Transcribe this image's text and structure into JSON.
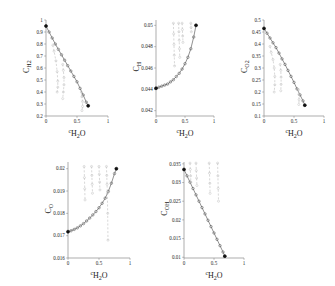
{
  "figure": {
    "background": "#ffffff",
    "axis_color": "#8a8a8a",
    "main_curve_color": "#6e6e6e",
    "branch_curve_color": "#b8b8b8",
    "endpoint_color": "#111111",
    "xlabel_prefix": "c",
    "xlabel_species": "H",
    "xlabel_species_sub": "2",
    "xlabel_species_tail": "O"
  },
  "chart_data": [
    {
      "type": "scatter",
      "panel": "top-left",
      "title": "",
      "xlabel": "cH2O",
      "ylabel": "CH2",
      "ylabel_base": "C",
      "ylabel_sub": "H",
      "ylabel_sub2": "2",
      "xlim": [
        0,
        1
      ],
      "ylim": [
        0.2,
        1
      ],
      "xticks": [
        0,
        0.5,
        1
      ],
      "xticklabels": [
        "0",
        "0.5",
        "1"
      ],
      "yticks": [
        0.2,
        0.3,
        0.4,
        0.5,
        0.6,
        0.7,
        0.8,
        0.9,
        1
      ],
      "yticklabels": [
        "0.2",
        "0.3",
        "0.4",
        "0.5",
        "0.6",
        "0.7",
        "0.8",
        "0.9",
        "1"
      ],
      "grid": false,
      "legend": "none",
      "series": [
        {
          "name": "main",
          "style": "solid-with-markers",
          "x": [
            0.0,
            0.05,
            0.1,
            0.15,
            0.2,
            0.25,
            0.3,
            0.35,
            0.4,
            0.45,
            0.5,
            0.55,
            0.6,
            0.65,
            0.68
          ],
          "y": [
            0.95,
            0.9,
            0.85,
            0.8,
            0.755,
            0.71,
            0.665,
            0.62,
            0.575,
            0.53,
            0.485,
            0.43,
            0.375,
            0.315,
            0.285
          ]
        },
        {
          "name": "branch-1",
          "style": "dashed",
          "x": [
            0.11,
            0.13,
            0.16,
            0.18,
            0.19,
            0.19,
            0.18
          ],
          "y": [
            0.79,
            0.74,
            0.66,
            0.57,
            0.49,
            0.44,
            0.4
          ]
        },
        {
          "name": "branch-2",
          "style": "dashed",
          "x": [
            0.27,
            0.28,
            0.29,
            0.29,
            0.28,
            0.27
          ],
          "y": [
            0.63,
            0.58,
            0.52,
            0.46,
            0.4,
            0.345
          ]
        },
        {
          "name": "branch-3",
          "style": "dashed",
          "x": [
            0.57,
            0.58,
            0.59,
            0.59,
            0.58
          ],
          "y": [
            0.4,
            0.36,
            0.32,
            0.28,
            0.245
          ]
        }
      ],
      "endpoints": [
        {
          "x": 0.0,
          "y": 0.95
        },
        {
          "x": 0.68,
          "y": 0.285
        }
      ]
    },
    {
      "type": "scatter",
      "panel": "top-center",
      "title": "",
      "xlabel": "cH2O",
      "ylabel": "CH",
      "ylabel_base": "C",
      "ylabel_sub": "H",
      "ylabel_sub2": "",
      "xlim": [
        0,
        1
      ],
      "ylim": [
        0.0415,
        0.0505
      ],
      "xticks": [
        0,
        0.5,
        1
      ],
      "xticklabels": [
        "0",
        "0.5",
        "1"
      ],
      "yticks": [
        0.042,
        0.044,
        0.046,
        0.048,
        0.05
      ],
      "yticklabels": [
        "0.042",
        "0.044",
        "0.046",
        "0.048",
        "0.05"
      ],
      "grid": false,
      "legend": "none",
      "series": [
        {
          "name": "main",
          "style": "solid-with-markers",
          "x": [
            0.0,
            0.05,
            0.1,
            0.15,
            0.2,
            0.25,
            0.3,
            0.35,
            0.4,
            0.45,
            0.5,
            0.55,
            0.6,
            0.65,
            0.69
          ],
          "y": [
            0.0441,
            0.0442,
            0.0443,
            0.0444,
            0.0445,
            0.0447,
            0.0449,
            0.0452,
            0.0455,
            0.0459,
            0.0464,
            0.047,
            0.0478,
            0.0489,
            0.05
          ]
        },
        {
          "name": "branch-1",
          "style": "dashed",
          "x": [
            0.3,
            0.305,
            0.31,
            0.315,
            0.32
          ],
          "y": [
            0.0502,
            0.0492,
            0.0482,
            0.0472,
            0.0462
          ]
        },
        {
          "name": "branch-2",
          "style": "dashed",
          "x": [
            0.39,
            0.395,
            0.4,
            0.405,
            0.41
          ],
          "y": [
            0.0502,
            0.0494,
            0.0486,
            0.0478,
            0.047
          ]
        },
        {
          "name": "branch-3",
          "style": "dashed",
          "x": [
            0.45,
            0.455,
            0.46,
            0.465
          ],
          "y": [
            0.0502,
            0.0496,
            0.049,
            0.0484
          ]
        },
        {
          "name": "branch-4",
          "style": "dashed",
          "x": [
            0.6,
            0.605,
            0.61
          ],
          "y": [
            0.0502,
            0.0498,
            0.0494
          ]
        }
      ],
      "endpoints": [
        {
          "x": 0.0,
          "y": 0.0441
        },
        {
          "x": 0.69,
          "y": 0.05
        }
      ]
    },
    {
      "type": "scatter",
      "panel": "top-right",
      "title": "",
      "xlabel": "cH2O",
      "ylabel": "CO2",
      "ylabel_base": "C",
      "ylabel_sub": "O",
      "ylabel_sub2": "2",
      "xlim": [
        0,
        1
      ],
      "ylim": [
        0.1,
        0.5
      ],
      "xticks": [
        0,
        0.5,
        1
      ],
      "xticklabels": [
        "0",
        "0.5",
        "1"
      ],
      "yticks": [
        0.1,
        0.15,
        0.2,
        0.25,
        0.3,
        0.35,
        0.4,
        0.45,
        0.5
      ],
      "yticklabels": [
        "0.1",
        "0.15",
        "0.2",
        "0.25",
        "0.3",
        "0.35",
        "0.4",
        "0.45",
        "0.5"
      ],
      "grid": false,
      "legend": "none",
      "series": [
        {
          "name": "main",
          "style": "solid-with-markers",
          "x": [
            0.0,
            0.05,
            0.1,
            0.15,
            0.2,
            0.25,
            0.3,
            0.35,
            0.4,
            0.45,
            0.5,
            0.55,
            0.6,
            0.65,
            0.68
          ],
          "y": [
            0.465,
            0.445,
            0.425,
            0.405,
            0.385,
            0.362,
            0.338,
            0.315,
            0.29,
            0.265,
            0.24,
            0.213,
            0.188,
            0.163,
            0.145
          ]
        },
        {
          "name": "branch-1",
          "style": "dashed",
          "x": [
            0.1,
            0.12,
            0.15,
            0.17,
            0.18,
            0.18,
            0.17
          ],
          "y": [
            0.39,
            0.365,
            0.335,
            0.3,
            0.265,
            0.23,
            0.2
          ]
        },
        {
          "name": "branch-2",
          "style": "dashed",
          "x": [
            0.27,
            0.28,
            0.285,
            0.285,
            0.28
          ],
          "y": [
            0.315,
            0.29,
            0.262,
            0.232,
            0.205
          ]
        },
        {
          "name": "branch-3",
          "style": "dashed",
          "x": [
            0.575,
            0.58,
            0.585,
            0.58
          ],
          "y": [
            0.21,
            0.19,
            0.168,
            0.148
          ]
        }
      ],
      "endpoints": [
        {
          "x": 0.0,
          "y": 0.465
        },
        {
          "x": 0.68,
          "y": 0.145
        }
      ]
    },
    {
      "type": "scatter",
      "panel": "bottom-left",
      "title": "",
      "xlabel": "cH2O",
      "ylabel": "CO",
      "ylabel_base": "C",
      "ylabel_sub": "O",
      "ylabel_sub2": "",
      "xlim": [
        0,
        1
      ],
      "ylim": [
        0.016,
        0.0203
      ],
      "xticks": [
        0,
        0.5,
        1
      ],
      "xticklabels": [
        "0",
        "0.5",
        "1"
      ],
      "yticks": [
        0.016,
        0.017,
        0.018,
        0.019,
        0.02
      ],
      "yticklabels": [
        "0.016",
        "0.017",
        "0.018",
        "0.019",
        "0.02"
      ],
      "grid": false,
      "legend": "none",
      "series": [
        {
          "name": "main",
          "style": "solid-with-markers",
          "x": [
            0.0,
            0.05,
            0.1,
            0.15,
            0.2,
            0.25,
            0.3,
            0.35,
            0.4,
            0.45,
            0.5,
            0.55,
            0.6,
            0.65,
            0.7,
            0.75,
            0.78
          ],
          "y": [
            0.01718,
            0.01722,
            0.01728,
            0.01735,
            0.01744,
            0.01754,
            0.01766,
            0.01779,
            0.01793,
            0.01808,
            0.01825,
            0.01845,
            0.01868,
            0.01898,
            0.01935,
            0.01978,
            0.02
          ]
        },
        {
          "name": "branch-1",
          "style": "dashed",
          "x": [
            0.26,
            0.265,
            0.27,
            0.275
          ],
          "y": [
            0.0201,
            0.0196,
            0.0191,
            0.0186
          ]
        },
        {
          "name": "branch-2",
          "style": "dashed",
          "x": [
            0.38,
            0.385,
            0.39,
            0.395
          ],
          "y": [
            0.0201,
            0.0197,
            0.0193,
            0.0189
          ]
        },
        {
          "name": "branch-3",
          "style": "dashed",
          "x": [
            0.5,
            0.505,
            0.51,
            0.515
          ],
          "y": [
            0.0201,
            0.01975,
            0.0194,
            0.01905
          ]
        },
        {
          "name": "branch-4",
          "style": "dashed",
          "x": [
            0.62,
            0.625,
            0.63,
            0.635,
            0.64,
            0.645
          ],
          "y": [
            0.0201,
            0.0197,
            0.0193,
            0.0189,
            0.018,
            0.0168
          ]
        }
      ],
      "endpoints": [
        {
          "x": 0.0,
          "y": 0.01718
        },
        {
          "x": 0.78,
          "y": 0.02
        }
      ]
    },
    {
      "type": "scatter",
      "panel": "bottom-center",
      "title": "",
      "xlabel": "cH2O",
      "ylabel": "COH",
      "ylabel_base": "C",
      "ylabel_sub": "OH",
      "ylabel_sub2": "",
      "xlim": [
        0,
        1
      ],
      "ylim": [
        0.0098,
        0.0355
      ],
      "xticks": [
        0,
        0.5,
        1
      ],
      "xticklabels": [
        "0",
        "0.5",
        "1"
      ],
      "yticks": [
        0.01,
        0.015,
        0.02,
        0.025,
        0.03,
        0.035
      ],
      "yticklabels": [
        "0.01",
        "0.015",
        "0.02",
        "0.025",
        "0.03",
        "0.035"
      ],
      "grid": false,
      "legend": "none",
      "series": [
        {
          "name": "main",
          "style": "solid-with-markers",
          "x": [
            0.0,
            0.05,
            0.1,
            0.15,
            0.2,
            0.25,
            0.3,
            0.35,
            0.4,
            0.45,
            0.5,
            0.55,
            0.6,
            0.65,
            0.68
          ],
          "y": [
            0.0335,
            0.0318,
            0.0301,
            0.0284,
            0.0267,
            0.025,
            0.0233,
            0.0216,
            0.0199,
            0.0182,
            0.0165,
            0.0148,
            0.0131,
            0.0114,
            0.0103
          ]
        },
        {
          "name": "branch-1",
          "style": "dashed",
          "x": [
            0.1,
            0.105,
            0.11,
            0.115
          ],
          "y": [
            0.0352,
            0.0335,
            0.0318,
            0.0301
          ]
        },
        {
          "name": "branch-2",
          "style": "dashed",
          "x": [
            0.2,
            0.205,
            0.21,
            0.215
          ],
          "y": [
            0.0352,
            0.0332,
            0.0312,
            0.0292
          ]
        },
        {
          "name": "branch-3",
          "style": "dashed",
          "x": [
            0.42,
            0.425,
            0.43,
            0.435
          ],
          "y": [
            0.0352,
            0.0325,
            0.0298,
            0.0271
          ]
        },
        {
          "name": "branch-4",
          "style": "dashed",
          "x": [
            0.56,
            0.565,
            0.57,
            0.575
          ],
          "y": [
            0.0352,
            0.0318,
            0.0284,
            0.025
          ]
        }
      ],
      "endpoints": [
        {
          "x": 0.0,
          "y": 0.0335
        },
        {
          "x": 0.68,
          "y": 0.0103
        }
      ]
    }
  ]
}
